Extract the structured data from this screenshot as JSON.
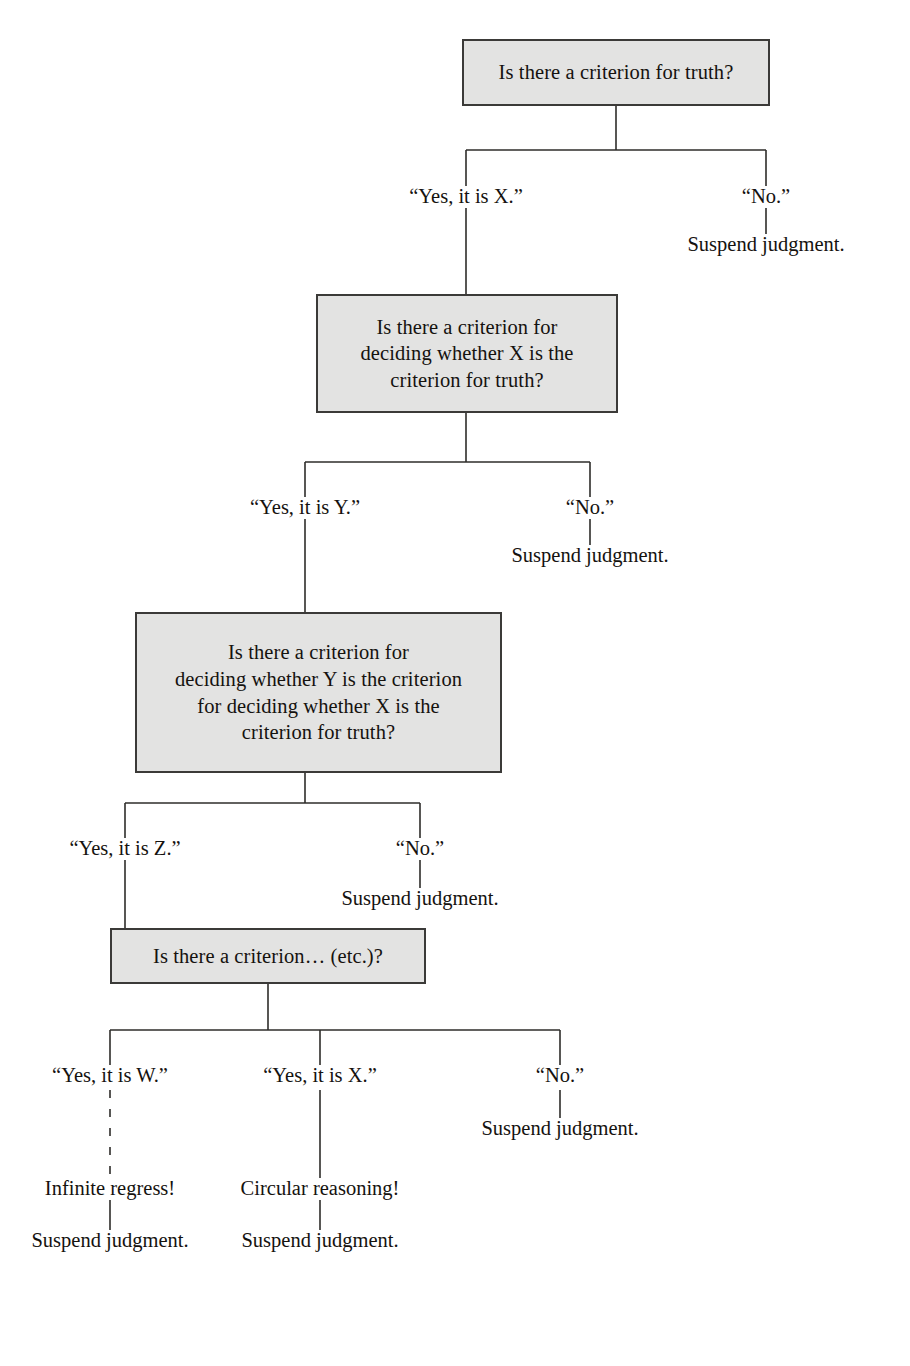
{
  "diagram": {
    "background_color": "#ffffff",
    "box_fill_color": "#e3e3e2",
    "box_border_color": "#3b3a38",
    "line_color": "#2e2c2a",
    "text_color": "#15120f"
  },
  "nodes": [
    {
      "id": "box1",
      "text": "Is there a criterion for truth?"
    },
    {
      "id": "box2",
      "text": "Is there a criterion for\ndeciding whether X is the\ncriterion for truth?"
    },
    {
      "id": "box3",
      "text": "Is there a criterion for\ndeciding whether Y is the criterion\nfor deciding whether X is the\ncriterion for truth?"
    },
    {
      "id": "box4",
      "text": "Is there a criterion… (etc.)?"
    }
  ],
  "labels": {
    "level1": {
      "yes": "“Yes, it is X.”",
      "no": "“No.”",
      "no_outcome": "Suspend judgment."
    },
    "level2": {
      "yes": "“Yes, it is Y.”",
      "no": "“No.”",
      "no_outcome": "Suspend judgment."
    },
    "level3": {
      "yes": "“Yes, it is Z.”",
      "no": "“No.”",
      "no_outcome": "Suspend judgment."
    },
    "level4": {
      "yes_w": "“Yes, it is W.”",
      "yes_x": "“Yes, it is X.”",
      "no": "“No.”",
      "w_outcome": "Infinite regress!",
      "w_final": "Suspend judgment.",
      "x_outcome": "Circular reasoning!",
      "x_final": "Suspend judgment.",
      "no_outcome": "Suspend judgment."
    }
  }
}
